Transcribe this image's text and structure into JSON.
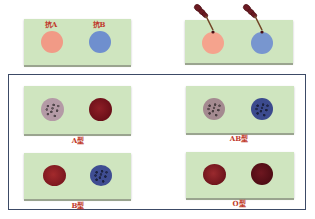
{
  "colors": {
    "slide_bg": "#cfe5bf",
    "label_red": "#c0392b",
    "frame_border": "#3c4a66",
    "anti_a_reagent": "#f19a86",
    "anti_b_reagent": "#6f8fce",
    "dropper": "#6b1a22",
    "agglut_pink_base": "#b49aa6",
    "agglut_blue_base": "#3c4b8e",
    "red_smooth": "#8c1c22",
    "dark_red_smooth": "#5a0f16"
  },
  "reagent_slide": {
    "labels": [
      "抗A",
      "抗B"
    ],
    "spots": [
      {
        "name": "anti-a-serum",
        "color": "#f19a86"
      },
      {
        "name": "anti-b-serum",
        "color": "#6f8fce"
      }
    ]
  },
  "dropping_slide": {
    "droppers": 2,
    "spots": [
      {
        "name": "anti-a-serum",
        "color": "#f5a38d"
      },
      {
        "name": "anti-b-serum",
        "color": "#7896cf"
      }
    ]
  },
  "results": [
    {
      "type": "A型",
      "left": "agglutinated",
      "right": "not-agglutinated"
    },
    {
      "type": "AB型",
      "left": "agglutinated",
      "right": "agglutinated"
    },
    {
      "type": "B型",
      "left": "not-agglutinated",
      "right": "agglutinated"
    },
    {
      "type": "O型",
      "left": "not-agglutinated",
      "right": "not-agglutinated"
    }
  ]
}
